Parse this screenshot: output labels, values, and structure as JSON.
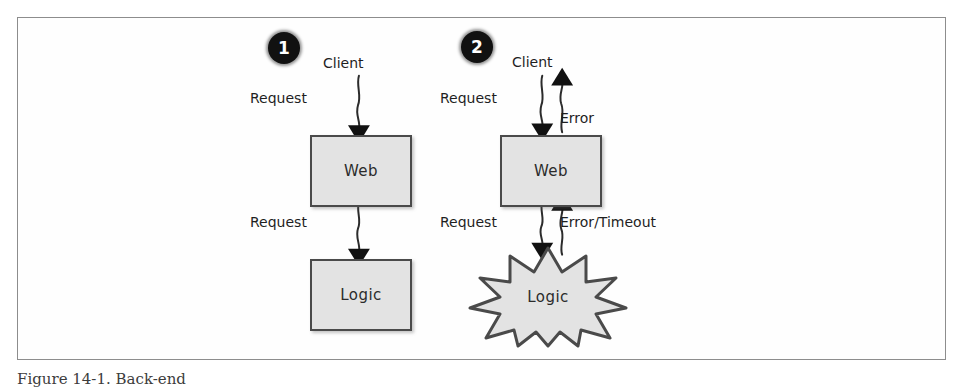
{
  "figure": {
    "caption": "Figure 14-1. Back-end",
    "frame_border_color": "#8d8d8d",
    "background_color": "#ffffff"
  },
  "diagram_data": {
    "type": "diagram",
    "style": "hand-drawn scanned book figure",
    "panels": [
      {
        "badge": "1",
        "description": "successful request flow",
        "nodes": [
          {
            "id": "client",
            "label": "Client",
            "shape": "text"
          },
          {
            "id": "web",
            "label": "Web",
            "shape": "rectangle",
            "fill": "#e3e3e3",
            "stroke": "#4a4a4a"
          },
          {
            "id": "logic",
            "label": "Logic",
            "shape": "rectangle",
            "fill": "#e3e3e3",
            "stroke": "#4a4a4a"
          }
        ],
        "edges": [
          {
            "from": "client",
            "to": "web",
            "label": "Request",
            "direction": "down"
          },
          {
            "from": "web",
            "to": "logic",
            "label": "Request",
            "direction": "down"
          }
        ]
      },
      {
        "badge": "2",
        "description": "failure cascade flow",
        "nodes": [
          {
            "id": "client",
            "label": "Client",
            "shape": "text"
          },
          {
            "id": "web",
            "label": "Web",
            "shape": "rectangle",
            "fill": "#e3e3e3",
            "stroke": "#4a4a4a"
          },
          {
            "id": "logic",
            "label": "Logic",
            "shape": "starburst",
            "fill": "#e3e3e3",
            "stroke": "#4a4a4a"
          }
        ],
        "edges": [
          {
            "from": "client",
            "to": "web",
            "label": "Request",
            "direction": "down"
          },
          {
            "from": "web",
            "to": "client",
            "label": "Error",
            "direction": "up"
          },
          {
            "from": "web",
            "to": "logic",
            "label": "Request",
            "direction": "down"
          },
          {
            "from": "logic",
            "to": "web",
            "label": "Error/Timeout",
            "direction": "up"
          }
        ]
      }
    ]
  },
  "panel1": {
    "badge": "1",
    "client_label": "Client",
    "request_top": "Request",
    "request_bottom": "Request",
    "web_label": "Web",
    "logic_label": "Logic"
  },
  "panel2": {
    "badge": "2",
    "client_label": "Client",
    "request_top": "Request",
    "error_top": "Error",
    "request_bottom": "Request",
    "error_bottom": "Error/Timeout",
    "web_label": "Web",
    "logic_label": "Logic"
  }
}
